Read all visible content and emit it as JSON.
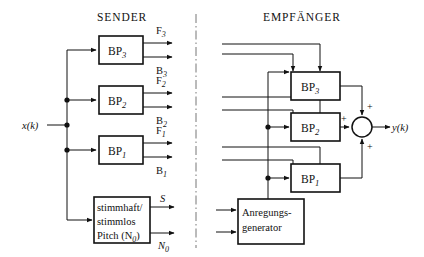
{
  "figure": {
    "title_left": "SENDER",
    "title_right": "EMPFÄNGER",
    "input_label": "x(k)",
    "output_label": "y(k)"
  },
  "sender": {
    "filters": [
      {
        "name": "BP",
        "index": "3",
        "out_forward": "F",
        "out_forward_sub": "3",
        "out_back": "B",
        "out_back_sub": "3"
      },
      {
        "name": "BP",
        "index": "2",
        "out_forward": "F",
        "out_forward_sub": "2",
        "out_back": "B",
        "out_back_sub": "2"
      },
      {
        "name": "BP",
        "index": "1",
        "out_forward": "F",
        "out_forward_sub": "1",
        "out_back": "B",
        "out_back_sub": "1"
      }
    ],
    "analyzer": {
      "line1": "stimmhaft/",
      "line2": "stimmlos",
      "line3_text": "Pitch (N",
      "line3_sub": "0",
      "line3_tail": ")",
      "out_top": "S",
      "out_bottom": "N",
      "out_bottom_sub": "0"
    }
  },
  "receiver": {
    "filters": [
      {
        "name": "BP",
        "index": "3"
      },
      {
        "name": "BP",
        "index": "2"
      },
      {
        "name": "BP",
        "index": "1"
      }
    ],
    "generator": {
      "line1": "Anregungs-",
      "line2": "generator"
    },
    "adder": {
      "sign_left": "+",
      "sign_top": "+",
      "sign_bottom": "+"
    }
  },
  "colors": {
    "ink": "#111111",
    "paper": "#ffffff",
    "divider": "#777777"
  }
}
